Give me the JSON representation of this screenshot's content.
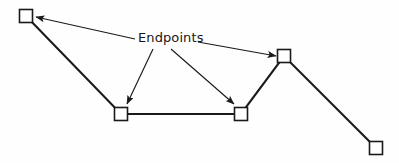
{
  "figure": {
    "name": "endpoints-annotated-polyline",
    "background_color": "#fefefe",
    "stroke_color": "#1a1a1a",
    "square_fill_color": "#ffffff",
    "width": 399,
    "height": 163
  },
  "annotations": {
    "endpoints_label": "Endpoints"
  },
  "diagram_data": {
    "type": "diagram",
    "description": "A multi-segment open polyline whose five vertices are each marked by a small hollow square. A single text label reads Endpoints and four leader arrows point from it to four of the vertices.",
    "polyline": {
      "stroke_width": 2.1,
      "closed": false,
      "vertices": [
        {
          "id": "v1",
          "label": "top-left endpoint",
          "x": 26,
          "y": 16
        },
        {
          "id": "v2",
          "label": "lower-left vertex",
          "x": 121,
          "y": 114
        },
        {
          "id": "v3",
          "label": "lower-right vertex",
          "x": 241,
          "y": 114
        },
        {
          "id": "v4",
          "label": "peak vertex",
          "x": 284,
          "y": 56
        },
        {
          "id": "v5",
          "label": "bottom-right endpoint",
          "x": 376,
          "y": 148
        }
      ],
      "path": "M 26 16 L 121 114 L 241 114 L 284 56 L 376 148"
    },
    "endpoint_markers": {
      "shape": "square",
      "size": 13,
      "fill": "#ffffff",
      "stroke": "#1a1a1a",
      "stroke_width": 1.6,
      "positions": [
        {
          "x": 26,
          "y": 16
        },
        {
          "x": 121,
          "y": 114
        },
        {
          "x": 241,
          "y": 114
        },
        {
          "x": 284,
          "y": 56
        },
        {
          "x": 376,
          "y": 148
        }
      ]
    },
    "leaders": [
      {
        "id": "leader-to-v1",
        "from": {
          "x": 135,
          "y": 39
        },
        "to": {
          "x": 36,
          "y": 17
        },
        "target_vertex": "v1",
        "direction": "up-left"
      },
      {
        "id": "leader-to-v2",
        "from": {
          "x": 153,
          "y": 49
        },
        "to": {
          "x": 127,
          "y": 104
        },
        "target_vertex": "v2",
        "direction": "down-left"
      },
      {
        "id": "leader-to-v3",
        "from": {
          "x": 171,
          "y": 49
        },
        "to": {
          "x": 234,
          "y": 104
        },
        "target_vertex": "v3",
        "direction": "down-right"
      },
      {
        "id": "leader-to-v4",
        "from": {
          "x": 198,
          "y": 42
        },
        "to": {
          "x": 276,
          "y": 56
        },
        "target_vertex": "v4",
        "direction": "right"
      }
    ],
    "label_position": {
      "x": 138,
      "y": 31
    }
  }
}
